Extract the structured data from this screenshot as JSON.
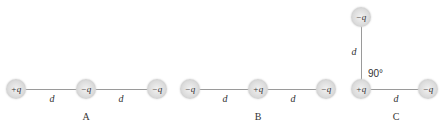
{
  "diagrams": [
    {
      "caption": "A",
      "charges": [
        "+q",
        "−q",
        "−q"
      ],
      "distances": [
        "d",
        "d"
      ]
    },
    {
      "caption": "B",
      "charges": [
        "−q",
        "+q",
        "−q"
      ],
      "distances": [
        "d",
        "d"
      ]
    },
    {
      "caption": "C",
      "charges": [
        "−q",
        "+q",
        "−q"
      ],
      "distances": [
        "d",
        "d"
      ],
      "angle": "90°"
    }
  ]
}
